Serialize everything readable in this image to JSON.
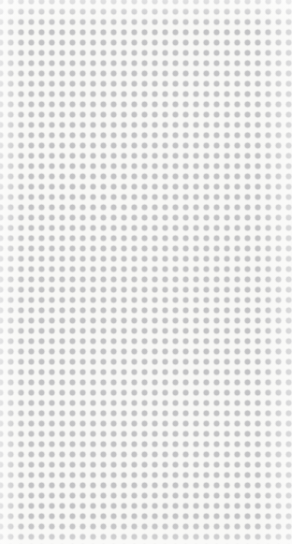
{
  "canvas": {
    "name": "dot-grid-canvas",
    "width": 292,
    "height": 544,
    "background_color": "#f7f7f5"
  },
  "pattern": {
    "name": "polka-dot-grid",
    "shape": "circle",
    "dot_color": "#c2c2c4",
    "dot_diameter": 6,
    "pitch_x": 10.3,
    "pitch_y": 10.3,
    "first_dot_center_x": 21,
    "first_dot_center_y": 22,
    "margin_left": 18,
    "margin_top": 19,
    "columns_full": 25,
    "columns_clipped_right": 1,
    "rows_full": 50,
    "rows_clipped_bottom": 1
  },
  "overlay": {
    "name": "edge-vignette",
    "description": "subtle white falloff at canvas edges",
    "color": "#ffffff"
  },
  "content": {
    "text_elements": [],
    "icons": [],
    "controls": []
  }
}
